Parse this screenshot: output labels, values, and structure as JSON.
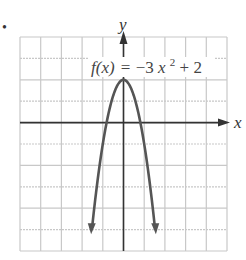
{
  "bullet": "•",
  "chart_data": {
    "type": "line",
    "title": "",
    "function_label": "f(x) = −3x² + 2",
    "equation": {
      "lhs": "f(x)",
      "eq": "=",
      "rhs_a": "−3",
      "rhs_var": "x",
      "rhs_exp": "2",
      "rhs_b": " + 2"
    },
    "xlabel": "x",
    "ylabel": "y",
    "xlim": [
      -5,
      5
    ],
    "ylim": [
      -6,
      4
    ],
    "grid": true,
    "grid_step": 1,
    "vertex": [
      0,
      2
    ],
    "x": [
      -1.52,
      -1.2,
      -1,
      -0.8,
      -0.5,
      0,
      0.5,
      0.8,
      1,
      1.2,
      1.52
    ],
    "values": [
      -4.93,
      -2.32,
      -1,
      0.08,
      1.25,
      2,
      1.25,
      0.08,
      -1,
      -2.32,
      -4.93
    ],
    "colors": {
      "curve": "#555555",
      "axes": "#333333",
      "grid": "#c8c8c8"
    }
  }
}
